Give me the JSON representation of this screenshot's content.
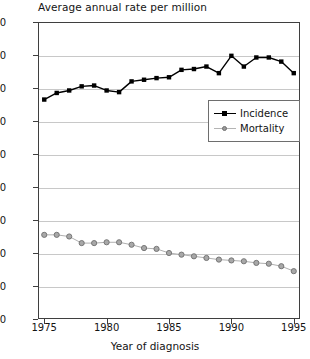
{
  "chart_data": {
    "type": "line",
    "title": "Average annual rate per million",
    "xlabel": "Year of diagnosis",
    "ylabel": "",
    "grid": true,
    "legend_position": "center-right",
    "xlim": [
      1974.5,
      1995.5
    ],
    "ylim": [
      0,
      180
    ],
    "ytick_labels": [
      "180",
      "160",
      "140",
      "120",
      "100",
      "80",
      "60",
      "40",
      "20",
      "0"
    ],
    "yticks": [
      180,
      160,
      140,
      120,
      100,
      80,
      60,
      40,
      20,
      0
    ],
    "xtick_labels": [
      "1975",
      "1980",
      "1985",
      "1990",
      "1995"
    ],
    "xticks": [
      1975,
      1980,
      1985,
      1990,
      1995
    ],
    "x": [
      1975,
      1976,
      1977,
      1978,
      1979,
      1980,
      1981,
      1982,
      1983,
      1984,
      1985,
      1986,
      1987,
      1988,
      1989,
      1990,
      1991,
      1992,
      1993,
      1994,
      1995
    ],
    "series": [
      {
        "name": "Incidence",
        "marker": "square",
        "color": "#000000",
        "values": [
          133,
          137,
          138.5,
          141,
          141.5,
          138.5,
          137.5,
          144,
          145,
          146,
          146.5,
          151,
          151.5,
          153,
          149,
          159.5,
          153,
          158.5,
          158.5,
          156,
          149
        ]
      },
      {
        "name": "Mortality",
        "marker": "circle",
        "color": "#8c8c8c",
        "values": [
          51,
          51,
          50,
          46,
          46,
          46.5,
          46.5,
          45,
          43,
          42.5,
          40,
          39,
          38,
          37,
          36,
          35.5,
          35,
          34,
          33.5,
          32,
          29
        ]
      }
    ]
  },
  "legend": {
    "items": [
      {
        "label": "Incidence"
      },
      {
        "label": "Mortality"
      }
    ]
  },
  "colors": {
    "incidence": "#000000",
    "mortality": "#8c8c8c",
    "grid": "#c8c8c8",
    "axis": "#3f3f3f",
    "text": "#141414",
    "background": "#ffffff"
  }
}
